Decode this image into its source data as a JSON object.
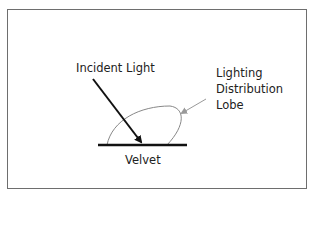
{
  "diagram": {
    "labels": {
      "incident": "Incident Light",
      "lobe": [
        "Lighting",
        "Distribution",
        "Lobe"
      ],
      "surface": "Velvet"
    },
    "colors": {
      "frame": "#6e6e6e",
      "arrow": "#111111",
      "lobe": "#888888",
      "surface": "#111111"
    }
  }
}
